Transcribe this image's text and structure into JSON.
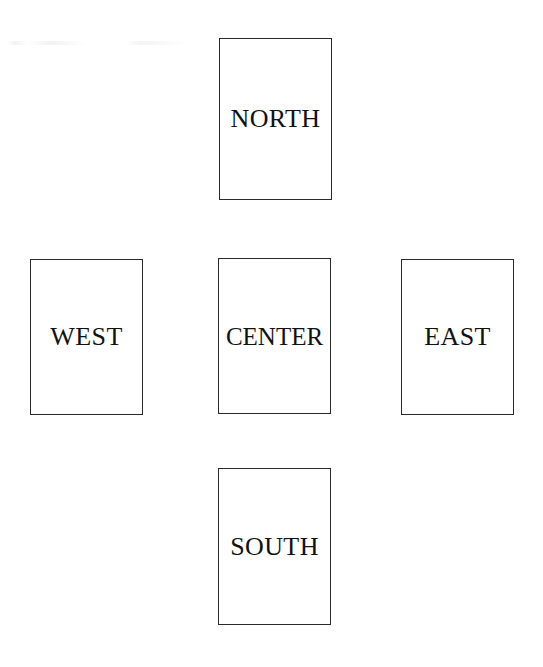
{
  "page": {
    "background_color": "#ffffff",
    "width": 543,
    "height": 667,
    "artifact_name": "scan-smudge"
  },
  "diagram": {
    "type": "border-layout",
    "border_color": "#2a2a2a",
    "text_color": "#111111",
    "regions": [
      {
        "id": "north",
        "label": "NORTH",
        "x": 219,
        "y": 38,
        "width": 113,
        "height": 162
      },
      {
        "id": "west",
        "label": "WEST",
        "x": 30,
        "y": 259,
        "width": 113,
        "height": 156
      },
      {
        "id": "center",
        "label": "CENTER",
        "x": 218,
        "y": 258,
        "width": 113,
        "height": 156
      },
      {
        "id": "east",
        "label": "EAST",
        "x": 401,
        "y": 259,
        "width": 113,
        "height": 156
      },
      {
        "id": "south",
        "label": "SOUTH",
        "x": 218,
        "y": 468,
        "width": 113,
        "height": 157
      }
    ]
  }
}
